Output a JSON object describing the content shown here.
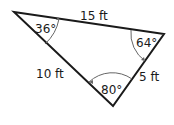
{
  "diagram": {
    "type": "triangle",
    "sides": [
      {
        "label": "15 ft",
        "between": [
          "A",
          "B"
        ]
      },
      {
        "label": "5 ft",
        "between": [
          "B",
          "C"
        ]
      },
      {
        "label": "10 ft",
        "between": [
          "A",
          "C"
        ]
      }
    ],
    "angles": [
      {
        "vertex": "A",
        "label": "36°"
      },
      {
        "vertex": "B",
        "label": "64°"
      },
      {
        "vertex": "C",
        "label": "80°"
      }
    ],
    "line_color": "#1a1a1a",
    "arc_color": "#555555"
  }
}
